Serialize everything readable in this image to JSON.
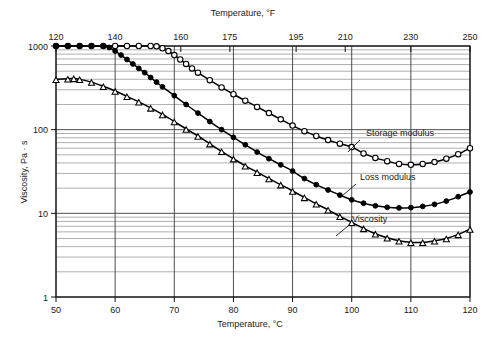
{
  "chart_data": {
    "type": "line",
    "title": "",
    "xlabel": "Temperature, °C",
    "xlabel_top": "Temperature, °F",
    "ylabel": "Viscosity, Pa · s",
    "xlim": [
      50,
      120
    ],
    "ylim": [
      1,
      1000
    ],
    "yscale": "log",
    "xscale": "linear",
    "grid": true,
    "grid_minor": true,
    "legend_position": "inline-annotations",
    "x_ticks_bottom": [
      "50",
      "60",
      "70",
      "80",
      "90",
      "100",
      "110",
      "120"
    ],
    "x_tick_values_bottom": [
      50,
      60,
      70,
      80,
      90,
      100,
      110,
      120
    ],
    "x_ticks_top": [
      "120",
      "140",
      "160",
      "175",
      "195",
      "210",
      "230",
      "250"
    ],
    "x_tick_values_top_celsius": [
      48.9,
      60.0,
      71.1,
      79.4,
      90.6,
      98.9,
      110.0,
      121.1
    ],
    "y_ticks": [
      "1000",
      "100",
      "10",
      "1"
    ],
    "y_tick_values": [
      1000,
      100,
      10,
      1
    ],
    "series": [
      {
        "name": "Storage modulus",
        "marker": "open-circle",
        "label_x": 104.5,
        "label_y": 95,
        "x": [
          50,
          52,
          54,
          56,
          58,
          60,
          62,
          64,
          66,
          67,
          68,
          69,
          70,
          71,
          72,
          73,
          74,
          76,
          78,
          80,
          82,
          84,
          86,
          88,
          90,
          92,
          94,
          96,
          98,
          100,
          102,
          104,
          106,
          108,
          110,
          112,
          114,
          116,
          118,
          120
        ],
        "y": [
          1000,
          1000,
          1000,
          1000,
          1000,
          1000,
          1000,
          1000,
          1000,
          990,
          940,
          870,
          780,
          690,
          610,
          540,
          480,
          390,
          320,
          265,
          222,
          187,
          158,
          133,
          112,
          96,
          84,
          75,
          68,
          62,
          52,
          46,
          42,
          39,
          38,
          39,
          41,
          45,
          51,
          60
        ]
      },
      {
        "name": "Loss modulus",
        "marker": "filled-circle",
        "label_x": 101,
        "label_y": 25,
        "x": [
          50,
          52,
          54,
          56,
          58,
          59,
          60,
          61,
          62,
          63,
          64,
          65,
          66,
          67,
          68,
          70,
          72,
          74,
          76,
          78,
          80,
          82,
          84,
          86,
          88,
          90,
          92,
          94,
          96,
          98,
          100,
          102,
          104,
          106,
          108,
          110,
          112,
          114,
          116,
          118,
          120
        ],
        "y": [
          1000,
          1000,
          1000,
          1000,
          1000,
          960,
          870,
          780,
          690,
          610,
          540,
          480,
          420,
          370,
          325,
          255,
          200,
          158,
          125,
          100,
          81,
          66,
          54,
          45,
          38,
          32,
          26,
          22,
          19,
          16.5,
          14.5,
          13.2,
          12.3,
          11.8,
          11.6,
          11.7,
          12.1,
          12.8,
          14.0,
          15.8,
          18.0
        ]
      },
      {
        "name": "Viscosity",
        "marker": "open-triangle",
        "label_x": 100.5,
        "label_y": 9.2,
        "x": [
          50,
          52,
          53,
          54,
          56,
          58,
          60,
          62,
          64,
          66,
          68,
          70,
          72,
          74,
          76,
          78,
          80,
          82,
          84,
          86,
          88,
          90,
          92,
          94,
          96,
          98,
          100,
          102,
          104,
          106,
          108,
          110,
          112,
          114,
          116,
          118,
          120
        ],
        "y": [
          400,
          405,
          410,
          400,
          370,
          330,
          290,
          250,
          215,
          182,
          152,
          125,
          102,
          84,
          68,
          55,
          45,
          37,
          31,
          26,
          22,
          18.5,
          15.5,
          13.0,
          11.0,
          9.2,
          7.8,
          6.6,
          5.7,
          5.1,
          4.7,
          4.5,
          4.5,
          4.7,
          5.0,
          5.6,
          6.5
        ]
      }
    ]
  },
  "annotations": {
    "storage": "Storage modulus",
    "loss": "Loss modulus",
    "viscosity": "Viscosity"
  }
}
